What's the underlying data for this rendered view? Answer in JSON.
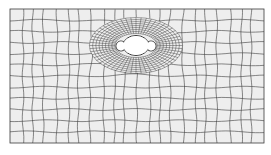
{
  "figure": {
    "type": "finite-element-mesh",
    "plate": {
      "x": 10,
      "y": 9,
      "width": 254,
      "height": 134
    },
    "hole": {
      "center": {
        "x": 136,
        "y": 45
      },
      "main_ellipse": {
        "rx": 13,
        "ry": 10
      },
      "lobes": [
        {
          "side": "left",
          "cx": 121,
          "cy": 46,
          "r": 5
        },
        {
          "side": "right",
          "cx": 151,
          "cy": 46,
          "r": 5
        }
      ]
    },
    "colors": {
      "background": "#ffffff",
      "plate_fill": "#eeeeee",
      "mesh_line": "#3a3a3a",
      "hole_fill": "#ffffff"
    },
    "coarse_grid": {
      "cols": 22,
      "rows": 12
    },
    "refined_rings": 8
  }
}
